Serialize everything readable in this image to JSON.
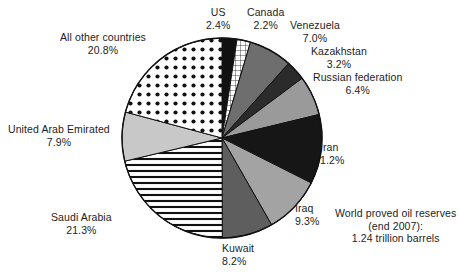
{
  "chart_data": {
    "type": "pie",
    "title": "World proved oil reserves (end 2007): 1.24 trillion barrels",
    "categories": [
      "US",
      "Canada",
      "Venezuela",
      "Kazakhstan",
      "Russian federation",
      "Iran",
      "Iraq",
      "Kuwait",
      "Saudi Arabia",
      "United Arab Emirated",
      "All other countries"
    ],
    "values": [
      2.4,
      2.2,
      7.0,
      3.2,
      6.4,
      11.2,
      9.3,
      8.2,
      21.3,
      7.9,
      20.8
    ],
    "value_labels": [
      "2.4%",
      "2.2%",
      "7.0%",
      "3.2%",
      "6.4%",
      "1.2%",
      "9.3%",
      "8.2%",
      "21.3%",
      "7.9%",
      "20.8%"
    ],
    "units": "percent of world proved oil reserves",
    "legend": "none (direct slice labels)",
    "start_angle_deg": 0,
    "direction": "clockwise",
    "slices": [
      {
        "name": "US",
        "percent_label": "2.4%",
        "percent": 2.4,
        "fill": "solid-black",
        "color": "#111111"
      },
      {
        "name": "Canada",
        "percent_label": "2.2%",
        "percent": 2.2,
        "fill": "grid-hatch",
        "color": "#ffffff"
      },
      {
        "name": "Venezuela",
        "percent_label": "7.0%",
        "percent": 7.0,
        "fill": "solid-gray",
        "color": "#6e6e6e"
      },
      {
        "name": "Kazakhstan",
        "percent_label": "3.2%",
        "percent": 3.2,
        "fill": "solid-dark",
        "color": "#2b2b2b"
      },
      {
        "name": "Russian federation",
        "percent_label": "6.4%",
        "percent": 6.4,
        "fill": "solid-midgray",
        "color": "#9a9a9a"
      },
      {
        "name": "Iran",
        "percent_label": "1.2%",
        "percent": 11.2,
        "fill": "solid-black",
        "color": "#161616"
      },
      {
        "name": "Iraq",
        "percent_label": "9.3%",
        "percent": 9.3,
        "fill": "solid-midgray",
        "color": "#a3a3a3"
      },
      {
        "name": "Kuwait",
        "percent_label": "8.2%",
        "percent": 8.2,
        "fill": "solid-gray",
        "color": "#5e5e5e"
      },
      {
        "name": "Saudi Arabia",
        "percent_label": "21.3%",
        "percent": 21.3,
        "fill": "horizontal-lines",
        "color": "#ffffff"
      },
      {
        "name": "United Arab Emirated",
        "percent_label": "7.9%",
        "percent": 7.9,
        "fill": "solid-lightgray",
        "color": "#c8c8c8"
      },
      {
        "name": "All other countries",
        "percent_label": "20.8%",
        "percent": 20.8,
        "fill": "dots",
        "color": "#ffffff"
      }
    ]
  },
  "labels": {
    "us": {
      "name": "US",
      "percent": "2.4%"
    },
    "canada": {
      "name": "Canada",
      "percent": "2.2%"
    },
    "venezuela": {
      "name": "Venezuela",
      "percent": "7.0%"
    },
    "kazakhstan": {
      "name": "Kazakhstan",
      "percent": "3.2%"
    },
    "russia": {
      "name": "Russian federation",
      "percent": "6.4%"
    },
    "iran": {
      "name": "Iran",
      "percent": "1.2%"
    },
    "iraq": {
      "name": "Iraq",
      "percent": "9.3%"
    },
    "kuwait": {
      "name": "Kuwait",
      "percent": "8.2%"
    },
    "saudi": {
      "name": "Saudi Arabia",
      "percent": "21.3%"
    },
    "uae": {
      "name": "United Arab Emirated",
      "percent": "7.9%"
    },
    "other": {
      "name": "All other countries",
      "percent": "20.8%"
    }
  },
  "caption": {
    "line1": "World proved oil reserves",
    "line2": "(end 2007):",
    "line3": "1.24 trillion barrels"
  },
  "geometry": {
    "center_x": 222,
    "center_y": 138,
    "radius": 100
  }
}
